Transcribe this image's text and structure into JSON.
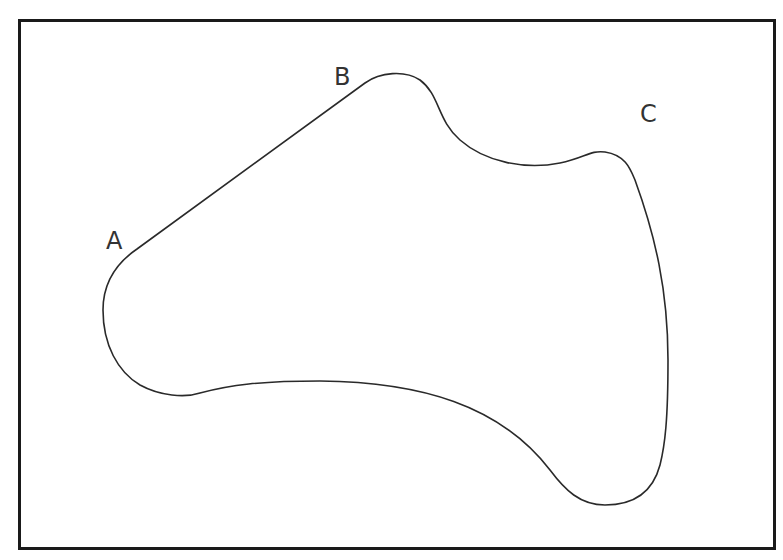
{
  "figure": {
    "labels": [
      {
        "id": "A",
        "text": "A",
        "x": 106,
        "y": 249
      },
      {
        "id": "B",
        "text": "B",
        "x": 334,
        "y": 85
      },
      {
        "id": "C",
        "text": "C",
        "x": 640,
        "y": 122
      }
    ],
    "colors": {
      "stroke": "#2a2a2a",
      "frame": "#1a1a1a",
      "background": "#ffffff"
    }
  }
}
